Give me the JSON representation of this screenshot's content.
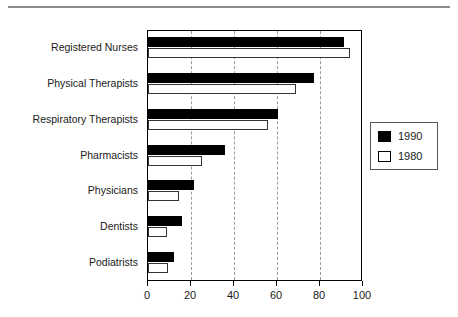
{
  "chart_data": {
    "type": "bar",
    "orientation": "horizontal",
    "title": "",
    "xlabel": "",
    "ylabel": "",
    "xlim": [
      0,
      100
    ],
    "xticks": [
      0,
      20,
      40,
      60,
      80,
      100
    ],
    "xtick_labels": [
      "0",
      "20",
      "40",
      "60",
      "80",
      "100"
    ],
    "grid": true,
    "grid_axis": "x",
    "grid_style": "dashed",
    "legend_position": "right",
    "categories": [
      "Registered Nurses",
      "Physical Therapists",
      "Respiratory Therapists",
      "Pharmacists",
      "Physicians",
      "Dentists",
      "Podiatrists"
    ],
    "series": [
      {
        "name": "1990",
        "color": "#000000",
        "values": [
          91,
          77,
          60.5,
          36,
          21.5,
          16,
          12
        ]
      },
      {
        "name": "1980",
        "color": "#ffffff",
        "values": [
          94,
          69,
          56,
          25,
          14.5,
          9,
          9.5
        ]
      }
    ]
  },
  "legend": {
    "entries": [
      {
        "label": "1990",
        "swatch": "filled"
      },
      {
        "label": "1980",
        "swatch": "hollow"
      }
    ]
  }
}
